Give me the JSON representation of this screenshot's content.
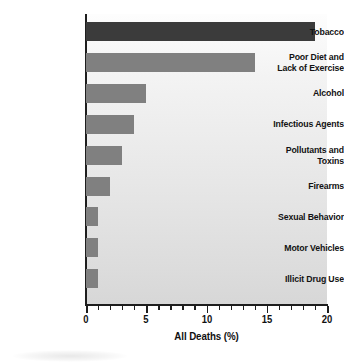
{
  "chart_data": {
    "type": "bar",
    "orientation": "horizontal",
    "title": "",
    "xlabel": "All Deaths (%)",
    "ylabel": "",
    "xlim": [
      0,
      20
    ],
    "ylim": null,
    "grid": false,
    "legend": null,
    "xticks": [
      0,
      5,
      10,
      15,
      20
    ],
    "xtick_labels": [
      "0",
      "5",
      "10",
      "15",
      "20"
    ],
    "xtick_minor_step": 1,
    "categories": [
      "Tobacco",
      "Poor Diet and Lack of Exercise",
      "Alcohol",
      "Infectious Agents",
      "Pollutants and Toxins",
      "Firearms",
      "Sexual Behavior",
      "Motor Vehicles",
      "Illicit Drug Use"
    ],
    "category_label_lines": [
      [
        "Tobacco"
      ],
      [
        "Poor Diet and",
        "Lack of Exercise"
      ],
      [
        "Alcohol"
      ],
      [
        "Infectious Agents"
      ],
      [
        "Pollutants and",
        "Toxins"
      ],
      [
        "Firearms"
      ],
      [
        "Sexual Behavior"
      ],
      [
        "Motor Vehicles"
      ],
      [
        "Illicit Drug Use"
      ]
    ],
    "values": [
      19,
      14,
      5,
      4,
      3,
      2,
      1,
      1,
      1
    ],
    "bar_colors": [
      "#3b3b3b",
      "#808080",
      "#808080",
      "#808080",
      "#808080",
      "#808080",
      "#808080",
      "#808080",
      "#808080"
    ],
    "plot_background": "#e8e8e8",
    "axis_color": "#1e1e1e",
    "highlight_color": "#3b3b3b",
    "series_color": "#808080"
  }
}
